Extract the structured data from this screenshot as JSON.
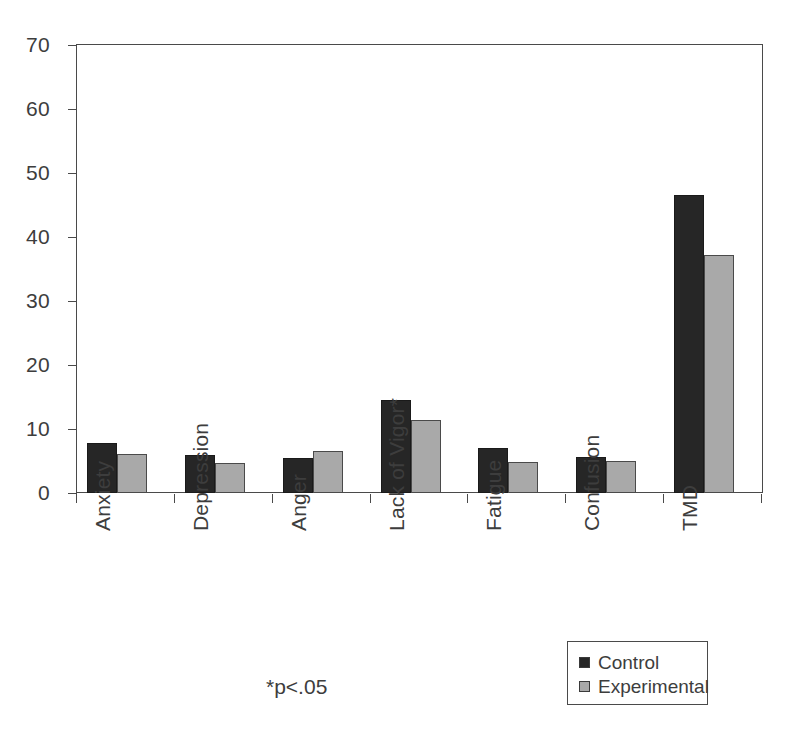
{
  "chart_data": {
    "type": "bar",
    "title": "",
    "xlabel": "",
    "ylabel": "",
    "ylim": [
      0,
      70
    ],
    "yticks": [
      0,
      10,
      20,
      30,
      40,
      50,
      60,
      70
    ],
    "grid": false,
    "legend_position": "bottom-right",
    "categories": [
      "Anxiety",
      "Depression",
      "Anger",
      "Lack of Vigor*",
      "Fatigue",
      "Confusion",
      "TMD"
    ],
    "series": [
      {
        "name": "Control",
        "color": "#262626",
        "values": [
          7.8,
          6.0,
          5.4,
          14.6,
          7.1,
          5.6,
          46.5
        ]
      },
      {
        "name": "Experimental",
        "color": "#a9a9a9",
        "values": [
          6.1,
          4.7,
          6.5,
          11.4,
          4.8,
          5.0,
          37.2
        ]
      }
    ],
    "annotations": [
      {
        "name": "significance-note",
        "text": "*p<.05"
      }
    ]
  },
  "axis": {
    "y_tick_labels": [
      "0",
      "10",
      "20",
      "30",
      "40",
      "50",
      "60",
      "70"
    ]
  },
  "legend": {
    "entries": [
      {
        "label": "Control",
        "swatch": "control"
      },
      {
        "label": "Experimental",
        "swatch": "experimental"
      }
    ]
  },
  "footnote": {
    "text": "*p<.05"
  }
}
